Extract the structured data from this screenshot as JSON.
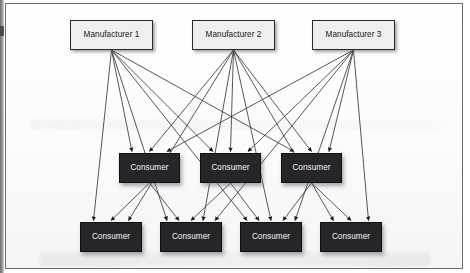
{
  "diagram": {
    "type": "directed-graph",
    "background_color": "#fdfdfd",
    "frame_color": "#6b6c6e",
    "manufacturer_fill": "#efeff0",
    "manufacturer_text_color": "#17171a",
    "consumer_fill": "#26262a",
    "consumer_text_color": "#f2f2f4",
    "edge_color": "#3a3a3e",
    "tiers": [
      {
        "name": "manufacturers",
        "nodes": [
          {
            "id": "m1",
            "label": "Manufacturer 1",
            "x": 70,
            "y": 20,
            "w": 83,
            "h": 30
          },
          {
            "id": "m2",
            "label": "Manufacturer 2",
            "x": 192,
            "y": 20,
            "w": 83,
            "h": 30
          },
          {
            "id": "m3",
            "label": "Manufacturer 3",
            "x": 312,
            "y": 20,
            "w": 83,
            "h": 30
          }
        ]
      },
      {
        "name": "middle-consumers",
        "nodes": [
          {
            "id": "c1",
            "label": "Consumer",
            "x": 119,
            "y": 153,
            "w": 61,
            "h": 30
          },
          {
            "id": "c2",
            "label": "Consumer",
            "x": 200,
            "y": 153,
            "w": 61,
            "h": 30
          },
          {
            "id": "c3",
            "label": "Consumer",
            "x": 281,
            "y": 153,
            "w": 61,
            "h": 30
          }
        ]
      },
      {
        "name": "bottom-consumers",
        "nodes": [
          {
            "id": "b1",
            "label": "Consumer",
            "x": 80,
            "y": 222,
            "w": 62,
            "h": 30
          },
          {
            "id": "b2",
            "label": "Consumer",
            "x": 160,
            "y": 222,
            "w": 62,
            "h": 30
          },
          {
            "id": "b3",
            "label": "Consumer",
            "x": 240,
            "y": 222,
            "w": 62,
            "h": 30
          },
          {
            "id": "b4",
            "label": "Consumer",
            "x": 320,
            "y": 222,
            "w": 62,
            "h": 30
          }
        ]
      }
    ],
    "edges": [
      {
        "from": "m1",
        "to": "c1"
      },
      {
        "from": "m1",
        "to": "c2"
      },
      {
        "from": "m1",
        "to": "c3"
      },
      {
        "from": "m1",
        "to": "b1"
      },
      {
        "from": "m1",
        "to": "b2"
      },
      {
        "from": "m1",
        "to": "b3"
      },
      {
        "from": "m2",
        "to": "c1"
      },
      {
        "from": "m2",
        "to": "c2"
      },
      {
        "from": "m2",
        "to": "c3"
      },
      {
        "from": "m2",
        "to": "b1"
      },
      {
        "from": "m2",
        "to": "b2"
      },
      {
        "from": "m2",
        "to": "b3"
      },
      {
        "from": "m2",
        "to": "b4"
      },
      {
        "from": "m3",
        "to": "c1"
      },
      {
        "from": "m3",
        "to": "c2"
      },
      {
        "from": "m3",
        "to": "c3"
      },
      {
        "from": "m3",
        "to": "b2"
      },
      {
        "from": "m3",
        "to": "b3"
      },
      {
        "from": "m3",
        "to": "b4"
      },
      {
        "from": "c1",
        "to": "b1"
      },
      {
        "from": "c1",
        "to": "b2"
      },
      {
        "from": "c2",
        "to": "b2"
      },
      {
        "from": "c2",
        "to": "b3"
      },
      {
        "from": "c3",
        "to": "b3"
      },
      {
        "from": "c3",
        "to": "b4"
      }
    ]
  }
}
